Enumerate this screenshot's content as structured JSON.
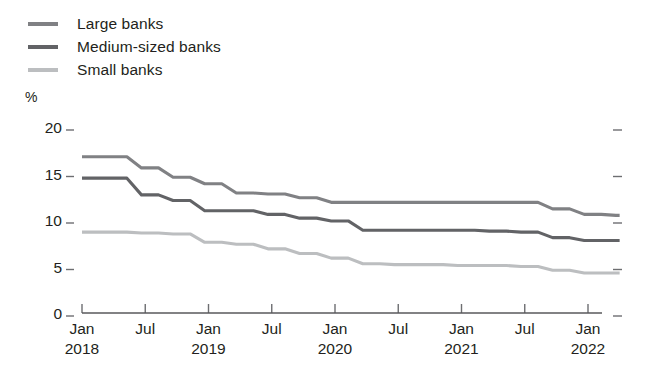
{
  "legend": {
    "position": "top-left",
    "items": [
      {
        "label": "Large banks",
        "color": "#808184"
      },
      {
        "label": "Medium-sized banks",
        "color": "#626366"
      },
      {
        "label": "Small banks",
        "color": "#bcbec0"
      }
    ]
  },
  "axis": {
    "unit_label": "%",
    "y_ticks": [
      "20",
      "15",
      "10",
      "5",
      "0"
    ],
    "x_tick_top": [
      "Jan",
      "Jul",
      "Jan",
      "Jul",
      "Jan",
      "Jul",
      "Jan",
      "Jul",
      "Jan"
    ],
    "x_tick_bottom": [
      "2018",
      "",
      "2019",
      "",
      "2020",
      "",
      "2021",
      "",
      "2022"
    ]
  },
  "chart_data": {
    "type": "line",
    "title": "",
    "subtitle": "",
    "xlabel": "",
    "ylabel": "%",
    "ylim": [
      0,
      20
    ],
    "yticks": [
      0,
      5,
      10,
      15,
      20
    ],
    "grid": false,
    "legend_position": "top-left",
    "step_style": "post-quarterly",
    "x": [
      "2018-01",
      "2018-04",
      "2018-07",
      "2018-10",
      "2019-01",
      "2019-04",
      "2019-07",
      "2019-10",
      "2020-01",
      "2020-04",
      "2020-07",
      "2020-10",
      "2021-01",
      "2021-04",
      "2021-07",
      "2021-10",
      "2022-01",
      "2022-04"
    ],
    "x_tick_labels": [
      "Jan 2018",
      "Jul",
      "Jan 2019",
      "Jul",
      "Jan 2020",
      "Jul",
      "Jan 2021",
      "Jul",
      "Jan 2022"
    ],
    "series": [
      {
        "name": "Large banks",
        "color": "#808184",
        "values": [
          16.8,
          16.8,
          15.6,
          14.6,
          13.9,
          12.9,
          12.8,
          12.4,
          11.9,
          11.9,
          11.9,
          11.9,
          11.9,
          11.9,
          11.9,
          11.2,
          10.6,
          10.5
        ]
      },
      {
        "name": "Medium-sized banks",
        "color": "#626366",
        "values": [
          14.5,
          14.5,
          12.7,
          12.1,
          11.0,
          11.0,
          10.6,
          10.2,
          9.9,
          8.9,
          8.9,
          8.9,
          8.9,
          8.8,
          8.7,
          8.1,
          7.8,
          7.8
        ]
      },
      {
        "name": "Small banks",
        "color": "#bcbec0",
        "values": [
          8.7,
          8.7,
          8.6,
          8.5,
          7.6,
          7.4,
          6.9,
          6.4,
          5.9,
          5.3,
          5.2,
          5.2,
          5.1,
          5.1,
          5.0,
          4.6,
          4.3,
          4.3
        ]
      }
    ]
  }
}
